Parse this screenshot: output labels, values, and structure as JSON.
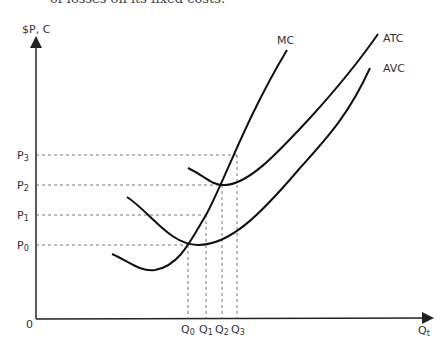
{
  "header": {
    "text_fragment": "of losses on its fixed costs."
  },
  "diagram": {
    "title": "",
    "y_axis_label": "$P, C",
    "x_axis_label": "Q",
    "x_axis_sub": "t",
    "origin_label": "0",
    "curves": [
      {
        "name": "MC",
        "label": "MC"
      },
      {
        "name": "ATC",
        "label": "ATC"
      },
      {
        "name": "AVC",
        "label": "AVC"
      }
    ],
    "price_levels": [
      {
        "label": "P",
        "sub": "3"
      },
      {
        "label": "P",
        "sub": "2"
      },
      {
        "label": "P",
        "sub": "1"
      },
      {
        "label": "P",
        "sub": "0"
      }
    ],
    "quantity_levels": [
      {
        "label": "Q",
        "sub": "0"
      },
      {
        "label": "Q",
        "sub": "1"
      },
      {
        "label": "Q",
        "sub": "2"
      },
      {
        "label": "Q",
        "sub": "3"
      }
    ],
    "colors": {
      "curve": "#111111",
      "axis": "#222222",
      "dashed": "#555555"
    }
  }
}
